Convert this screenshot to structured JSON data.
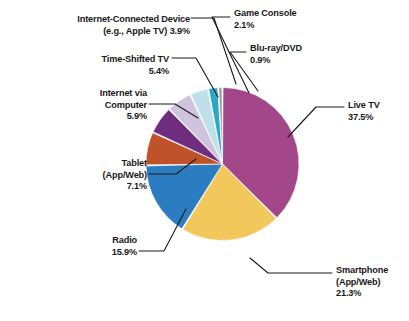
{
  "chart_data": {
    "type": "pie",
    "title": "",
    "subtitle": "",
    "xlabel": "",
    "ylabel": "",
    "legend_position": "none",
    "grid": false,
    "label_style": "callout-leader-lines",
    "units": "percent",
    "total": 100.0,
    "start_angle_deg": 0,
    "direction": "clockwise",
    "categories": [
      "Live TV",
      "Smartphone (App/Web)",
      "Radio",
      "Tablet (App/Web)",
      "Internet via Computer",
      "Time-Shifted TV",
      "Internet-Connected Device (e.g., Apple TV)",
      "Game Console",
      "Blu-ray/DVD"
    ],
    "values": [
      37.5,
      21.3,
      15.9,
      7.1,
      5.9,
      5.4,
      3.9,
      2.1,
      0.9
    ],
    "colors": [
      "#A4478A",
      "#F2C75C",
      "#2B7CC0",
      "#C0522A",
      "#6E2D7E",
      "#CFC3DE",
      "#BFE0E8",
      "#2CA8C4",
      "#9A9A9A"
    ],
    "slices": [
      {
        "name": "Live TV",
        "value": 37.5,
        "label_line1": "Live TV",
        "label_line2": "37.5%",
        "color": "#A4478A"
      },
      {
        "name": "Smartphone",
        "value": 21.3,
        "label_line1": "Smartphone",
        "label_line2": "(App/Web)",
        "label_line3": "21.3%",
        "color": "#F2C75C"
      },
      {
        "name": "Radio",
        "value": 15.9,
        "label_line1": "Radio",
        "label_line2": "15.9%",
        "color": "#2B7CC0"
      },
      {
        "name": "Tablet",
        "value": 7.1,
        "label_line1": "Tablet",
        "label_line2": "(App/Web)",
        "label_line3": "7.1%",
        "color": "#C0522A"
      },
      {
        "name": "Internet via Computer",
        "value": 5.9,
        "label_line1": "Internet via",
        "label_line2": "Computer",
        "label_line3": "5.9%",
        "color": "#6E2D7E"
      },
      {
        "name": "Time-Shifted TV",
        "value": 5.4,
        "label_line1": "Time-Shifted TV",
        "label_line2": "5.4%",
        "color": "#CFC3DE"
      },
      {
        "name": "Internet-Connected Device",
        "value": 3.9,
        "label_line1": "Internet-Connected Device",
        "label_line2": "(e.g., Apple TV) 3.9%",
        "color": "#BFE0E8"
      },
      {
        "name": "Game Console",
        "value": 2.1,
        "label_line1": "Game Console",
        "label_line2": "2.1%",
        "color": "#2CA8C4"
      },
      {
        "name": "Blu-ray/DVD",
        "value": 0.9,
        "label_line1": "Blu-ray/DVD",
        "label_line2": "0.9%",
        "color": "#9A9A9A"
      }
    ]
  },
  "labels": {
    "live_tv": "Live TV\n37.5%",
    "smartphone": "Smartphone\n(App/Web)\n21.3%",
    "radio": "Radio\n15.9%",
    "tablet": "Tablet\n(App/Web)\n7.1%",
    "internet_computer": "Internet via\nComputer\n5.9%",
    "time_shifted": "Time-Shifted TV\n5.4%",
    "internet_device": "Internet-Connected Device\n(e.g., Apple TV) 3.9%",
    "game_console": "Game Console\n2.1%",
    "bluray": "Blu-ray/DVD\n0.9%"
  },
  "style": {
    "background": "#ffffff",
    "text_color": "#1a1a1a",
    "leader_line_color": "#1a1a1a",
    "slice_separator": "#ffffff"
  }
}
